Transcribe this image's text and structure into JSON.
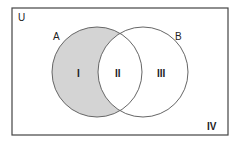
{
  "diagram": {
    "type": "venn",
    "universe_label": "U",
    "sets": [
      {
        "label": "A",
        "shaded": "A only"
      },
      {
        "label": "B"
      }
    ],
    "regions": [
      {
        "label": "I",
        "description": "A only",
        "shaded": true
      },
      {
        "label": "II",
        "description": "A and B",
        "shaded": false
      },
      {
        "label": "III",
        "description": "B only",
        "shaded": false
      },
      {
        "label": "IV",
        "description": "outside A and B",
        "shaded": false
      }
    ],
    "colors": {
      "shade": "#d4d4d4",
      "stroke": "#555555"
    }
  }
}
